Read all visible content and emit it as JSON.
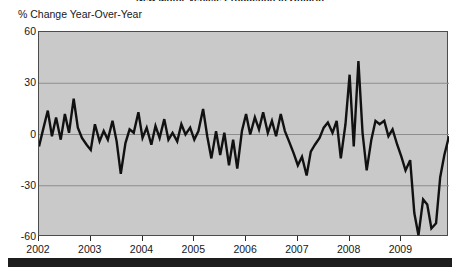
{
  "figure": {
    "title": "New Motor Vehicle Production in Ontario",
    "background": "#ffffff",
    "plot_background": "#c9c9c9",
    "line_color": "#111111",
    "grid_color": "#8d8d8d",
    "frame_color": "#4c4c4c",
    "bottom_bar_color": "#1d1d1d"
  },
  "chart_data": {
    "type": "line",
    "title": "New Motor Vehicle Production in Ontario",
    "xlabel": "",
    "ylabel": "% Change Year-Over-Year",
    "ylim": [
      -60,
      60
    ],
    "xlim": [
      2002.0,
      2009.92
    ],
    "yticks": [
      60,
      30,
      0,
      -30,
      -60
    ],
    "ytick_labels": [
      "60",
      "30",
      "0",
      "-30",
      "-60"
    ],
    "xticks": [
      2002,
      2003,
      2004,
      2005,
      2006,
      2007,
      2008,
      2009
    ],
    "xtick_labels": [
      "2002",
      "2003",
      "2004",
      "2005",
      "2006",
      "2007",
      "2008",
      "2009"
    ],
    "grid": true,
    "grid_axis": "y",
    "legend": null,
    "series": [
      {
        "name": "% Change Year-Over-Year",
        "color": "#111111",
        "x": [
          2002.0,
          2002.08,
          2002.17,
          2002.25,
          2002.33,
          2002.42,
          2002.5,
          2002.58,
          2002.67,
          2002.75,
          2002.83,
          2002.92,
          2003.0,
          2003.08,
          2003.17,
          2003.25,
          2003.33,
          2003.42,
          2003.5,
          2003.58,
          2003.67,
          2003.75,
          2003.83,
          2003.92,
          2004.0,
          2004.08,
          2004.17,
          2004.25,
          2004.33,
          2004.42,
          2004.5,
          2004.58,
          2004.67,
          2004.75,
          2004.83,
          2004.92,
          2005.0,
          2005.08,
          2005.17,
          2005.25,
          2005.33,
          2005.42,
          2005.5,
          2005.58,
          2005.67,
          2005.75,
          2005.83,
          2005.92,
          2006.0,
          2006.08,
          2006.17,
          2006.25,
          2006.33,
          2006.42,
          2006.5,
          2006.58,
          2006.67,
          2006.75,
          2006.83,
          2006.92,
          2007.0,
          2007.08,
          2007.17,
          2007.25,
          2007.33,
          2007.42,
          2007.5,
          2007.58,
          2007.67,
          2007.75,
          2007.83,
          2007.92,
          2008.0,
          2008.08,
          2008.17,
          2008.25,
          2008.33,
          2008.42,
          2008.5,
          2008.58,
          2008.67,
          2008.75,
          2008.83,
          2008.92,
          2009.0,
          2009.08,
          2009.17,
          2009.25,
          2009.33,
          2009.42,
          2009.5,
          2009.58,
          2009.67,
          2009.75,
          2009.83,
          2009.92
        ],
        "values": [
          -7,
          3,
          14,
          -1,
          10,
          -3,
          12,
          1,
          21,
          4,
          -2,
          -6,
          -9,
          6,
          -4,
          2,
          -3,
          8,
          -4,
          -23,
          -5,
          3,
          1,
          13,
          -2,
          4,
          -6,
          5,
          -2,
          9,
          -3,
          1,
          -4,
          6,
          0,
          4,
          -3,
          2,
          15,
          -1,
          -14,
          2,
          -12,
          1,
          -18,
          -3,
          -20,
          2,
          12,
          0,
          10,
          3,
          13,
          1,
          8,
          -1,
          12,
          2,
          -4,
          -11,
          -18,
          -13,
          -24,
          -10,
          -6,
          -2,
          4,
          7,
          1,
          8,
          -14,
          6,
          35,
          -7,
          43,
          1,
          -21,
          -3,
          8,
          6,
          8,
          -1,
          3,
          -6,
          -13,
          -21,
          -15,
          -46,
          -59,
          -38,
          -41,
          -55,
          -52,
          -25,
          -12,
          -1
        ]
      }
    ],
    "annotations": []
  },
  "axes": {
    "y_caption": "% Change Year-Over-Year"
  }
}
